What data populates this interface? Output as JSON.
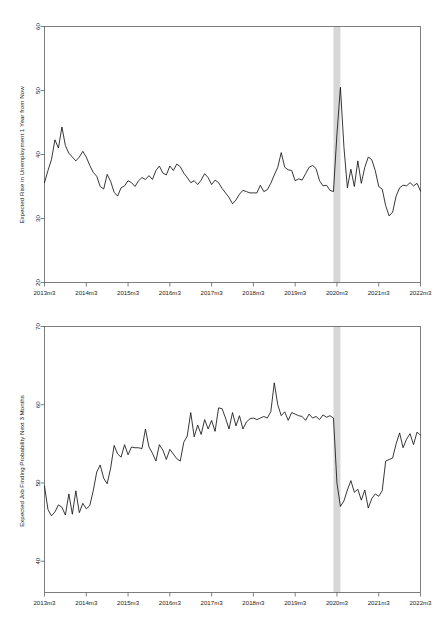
{
  "figure": {
    "panel_count": 2,
    "background_color": "#ffffff",
    "line_color": "#141414",
    "recession_band_color": "#d4d4d4",
    "axis_color": "#5e5e5e"
  },
  "chart_data": [
    {
      "type": "line",
      "title": "",
      "xlabel": "",
      "ylabel": "Expected Rise in Unemployment 1 Year from Now",
      "ylim": [
        20,
        60
      ],
      "yticks": [
        20,
        30,
        40,
        50,
        60
      ],
      "ytick_labels": [
        "20",
        "30",
        "40",
        "50",
        "60"
      ],
      "xlim": [
        "2013m3",
        "2022m3"
      ],
      "xticks": [
        "2013m3",
        "2014m3",
        "2015m3",
        "2016m3",
        "2017m3",
        "2018m3",
        "2019m3",
        "2020m3",
        "2021m3",
        "2022m3"
      ],
      "xtick_labels": [
        "2013m3",
        "2014m3",
        "2015m3",
        "2016m3",
        "2017m3",
        "2018m3",
        "2019m3",
        "2020m3",
        "2021m3",
        "2022m3"
      ],
      "grid": false,
      "legend": false,
      "annotations": [
        {
          "kind": "vertical-band",
          "label": "COVID-19 recession",
          "start": "2020m2",
          "end": "2020m4",
          "color": "#d4d4d4"
        }
      ],
      "x": [
        "2013m3",
        "2013m4",
        "2013m5",
        "2013m6",
        "2013m7",
        "2013m8",
        "2013m9",
        "2013m10",
        "2013m11",
        "2013m12",
        "2014m1",
        "2014m2",
        "2014m3",
        "2014m4",
        "2014m5",
        "2014m6",
        "2014m7",
        "2014m8",
        "2014m9",
        "2014m10",
        "2014m11",
        "2014m12",
        "2015m1",
        "2015m2",
        "2015m3",
        "2015m4",
        "2015m5",
        "2015m6",
        "2015m7",
        "2015m8",
        "2015m9",
        "2015m10",
        "2015m11",
        "2015m12",
        "2016m1",
        "2016m2",
        "2016m3",
        "2016m4",
        "2016m5",
        "2016m6",
        "2016m7",
        "2016m8",
        "2016m9",
        "2016m10",
        "2016m11",
        "2016m12",
        "2017m1",
        "2017m2",
        "2017m3",
        "2017m4",
        "2017m5",
        "2017m6",
        "2017m7",
        "2017m8",
        "2017m9",
        "2017m10",
        "2017m11",
        "2017m12",
        "2018m1",
        "2018m2",
        "2018m3",
        "2018m4",
        "2018m5",
        "2018m6",
        "2018m7",
        "2018m8",
        "2018m9",
        "2018m10",
        "2018m11",
        "2018m12",
        "2019m1",
        "2019m2",
        "2019m3",
        "2019m4",
        "2019m5",
        "2019m6",
        "2019m7",
        "2019m8",
        "2019m9",
        "2019m10",
        "2019m11",
        "2019m12",
        "2020m1",
        "2020m2",
        "2020m3",
        "2020m4",
        "2020m5",
        "2020m6",
        "2020m7",
        "2020m8",
        "2020m9",
        "2020m10",
        "2020m11",
        "2020m12",
        "2021m1",
        "2021m2",
        "2021m3",
        "2021m4",
        "2021m5",
        "2021m6",
        "2021m7",
        "2021m8",
        "2021m9",
        "2021m10",
        "2021m11",
        "2021m12",
        "2022m1",
        "2022m2",
        "2022m3"
      ],
      "values": [
        35.6,
        37.5,
        39.2,
        42.3,
        41.0,
        44.3,
        41.4,
        40.2,
        39.6,
        39.0,
        39.6,
        40.5,
        39.6,
        38.3,
        37.2,
        36.6,
        35.0,
        34.6,
        36.9,
        35.8,
        34.1,
        33.5,
        34.8,
        35.1,
        35.9,
        35.6,
        35.0,
        35.9,
        36.4,
        36.1,
        36.7,
        36.1,
        37.5,
        38.2,
        37.1,
        36.8,
        38.2,
        37.5,
        38.5,
        38.1,
        37.1,
        36.4,
        35.6,
        35.9,
        35.3,
        36.0,
        37.0,
        36.4,
        35.3,
        36.0,
        35.6,
        34.7,
        34.0,
        33.3,
        32.3,
        32.9,
        33.8,
        34.4,
        34.2,
        34.0,
        34.0,
        34.0,
        35.2,
        34.2,
        34.5,
        35.5,
        36.8,
        38.0,
        40.3,
        38.0,
        37.6,
        37.5,
        35.9,
        36.2,
        36.0,
        37.0,
        38.0,
        38.3,
        37.8,
        35.9,
        35.1,
        35.2,
        34.4,
        34.2,
        43.2,
        50.5,
        41.2,
        34.8,
        37.7,
        35.0,
        39.0,
        35.5,
        38.0,
        39.6,
        39.2,
        37.5,
        35.0,
        34.6,
        32.0,
        30.4,
        31.0,
        33.5,
        34.8,
        35.2,
        35.1,
        35.6,
        35.1,
        35.5,
        34.3
      ]
    },
    {
      "type": "line",
      "title": "",
      "xlabel": "",
      "ylabel": "Expected Job Finding Probability Next 3 Months",
      "ylim": [
        36,
        70
      ],
      "yticks": [
        40,
        50,
        60,
        70
      ],
      "ytick_labels": [
        "40",
        "50",
        "60",
        "70"
      ],
      "xlim": [
        "2013m3",
        "2022m3"
      ],
      "xticks": [
        "2013m3",
        "2014m3",
        "2015m3",
        "2016m3",
        "2017m3",
        "2018m3",
        "2019m3",
        "2020m3",
        "2021m3",
        "2022m3"
      ],
      "xtick_labels": [
        "2013m3",
        "2014m3",
        "2015m3",
        "2016m3",
        "2017m3",
        "2018m3",
        "2019m3",
        "2020m3",
        "2021m3",
        "2022m3"
      ],
      "grid": false,
      "legend": false,
      "annotations": [
        {
          "kind": "vertical-band",
          "label": "COVID-19 recession",
          "start": "2020m2",
          "end": "2020m4",
          "color": "#d4d4d4"
        }
      ],
      "x": [
        "2013m3",
        "2013m4",
        "2013m5",
        "2013m6",
        "2013m7",
        "2013m8",
        "2013m9",
        "2013m10",
        "2013m11",
        "2013m12",
        "2014m1",
        "2014m2",
        "2014m3",
        "2014m4",
        "2014m5",
        "2014m6",
        "2014m7",
        "2014m8",
        "2014m9",
        "2014m10",
        "2014m11",
        "2014m12",
        "2015m1",
        "2015m2",
        "2015m3",
        "2015m4",
        "2015m5",
        "2015m6",
        "2015m7",
        "2015m8",
        "2015m9",
        "2015m10",
        "2015m11",
        "2015m12",
        "2016m1",
        "2016m2",
        "2016m3",
        "2016m4",
        "2016m5",
        "2016m6",
        "2016m7",
        "2016m8",
        "2016m9",
        "2016m10",
        "2016m11",
        "2016m12",
        "2017m1",
        "2017m2",
        "2017m3",
        "2017m4",
        "2017m5",
        "2017m6",
        "2017m7",
        "2017m8",
        "2017m9",
        "2017m10",
        "2017m11",
        "2017m12",
        "2018m1",
        "2018m2",
        "2018m3",
        "2018m4",
        "2018m5",
        "2018m6",
        "2018m7",
        "2018m8",
        "2018m9",
        "2018m10",
        "2018m11",
        "2018m12",
        "2019m1",
        "2019m2",
        "2019m3",
        "2019m4",
        "2019m5",
        "2019m6",
        "2019m7",
        "2019m8",
        "2019m9",
        "2019m10",
        "2019m11",
        "2019m12",
        "2020m1",
        "2020m2",
        "2020m3",
        "2020m4",
        "2020m5",
        "2020m6",
        "2020m7",
        "2020m8",
        "2020m9",
        "2020m10",
        "2020m11",
        "2020m12",
        "2021m1",
        "2021m2",
        "2021m3",
        "2021m4",
        "2021m5",
        "2021m6",
        "2021m7",
        "2021m8",
        "2021m9",
        "2021m10",
        "2021m11",
        "2021m12",
        "2022m1",
        "2022m2",
        "2022m3"
      ],
      "values": [
        49.6,
        46.6,
        45.8,
        46.3,
        47.2,
        46.9,
        45.9,
        48.6,
        46.0,
        49.0,
        46.2,
        47.4,
        46.7,
        47.1,
        49.0,
        51.4,
        52.3,
        50.6,
        49.9,
        51.9,
        54.8,
        53.7,
        53.3,
        54.9,
        53.6,
        54.6,
        54.5,
        54.5,
        54.4,
        56.9,
        54.6,
        53.8,
        52.8,
        54.9,
        54.2,
        53.0,
        54.3,
        53.7,
        53.1,
        52.8,
        55.2,
        56.0,
        59.0,
        55.9,
        57.4,
        56.2,
        58.1,
        56.9,
        58.0,
        56.6,
        59.6,
        59.5,
        58.3,
        56.9,
        59.0,
        57.3,
        58.6,
        56.9,
        57.8,
        58.2,
        58.3,
        58.1,
        58.3,
        58.5,
        58.3,
        59.1,
        62.8,
        60.0,
        58.6,
        59.1,
        58.0,
        59.0,
        58.8,
        58.6,
        58.5,
        58.0,
        58.8,
        58.3,
        58.5,
        58.1,
        58.7,
        58.4,
        58.6,
        58.3,
        50.0,
        47.0,
        47.7,
        49.1,
        50.3,
        48.8,
        49.2,
        47.8,
        49.1,
        46.8,
        48.0,
        48.6,
        48.3,
        49.0,
        52.8,
        53.0,
        53.2,
        55.0,
        56.4,
        54.5,
        55.6,
        56.3,
        54.9,
        56.5,
        56.1
      ]
    }
  ]
}
